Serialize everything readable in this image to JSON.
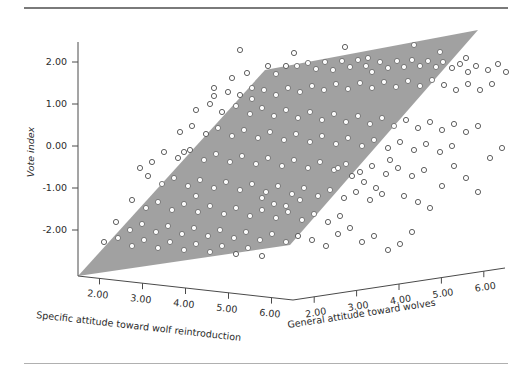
{
  "figure": {
    "background_color": "#ffffff",
    "plane_color": "#9a9a9a",
    "point_stroke_color": "#4f4f4f",
    "axis_color": "#4a4a4a"
  },
  "chart_data": {
    "type": "scatter",
    "title": "",
    "subtitle": "",
    "projection": "3d",
    "grid": false,
    "legend": null,
    "annotations": [],
    "surface": {
      "label": "regression plane",
      "color": "#9a9a9a",
      "screen_vertices": [
        [
          78,
          276
        ],
        [
          265,
          70
        ],
        [
          478,
          30
        ],
        [
          290,
          245
        ]
      ]
    },
    "axes": {
      "x": {
        "label": "Specific attitude toward wolf reintroduction",
        "ticks": [
          "2.00",
          "3.00",
          "4.00",
          "5.00",
          "6.00"
        ],
        "tickvalues": [
          2,
          3,
          4,
          5,
          6
        ],
        "range": [
          1.2,
          6.6
        ]
      },
      "y": {
        "label": "General attitude toward wolves",
        "ticks": [
          "2.00",
          "3.00",
          "4.00",
          "5.00",
          "6.00"
        ],
        "tickvalues": [
          2,
          3,
          4,
          5,
          6
        ],
        "range": [
          1.2,
          6.6
        ]
      },
      "z": {
        "label": "Vote index",
        "ticks": [
          "2.00",
          "1.00",
          "0.00",
          "-1.00",
          "-2.00"
        ],
        "tickvalues": [
          2,
          1,
          0,
          -1,
          -2
        ],
        "range": [
          -2.7,
          2.7
        ]
      }
    },
    "points": [
      [
        240,
        50
      ],
      [
        294,
        53
      ],
      [
        345,
        47
      ],
      [
        368,
        58
      ],
      [
        414,
        45
      ],
      [
        440,
        52
      ],
      [
        466,
        58
      ],
      [
        214,
        88
      ],
      [
        232,
        78
      ],
      [
        247,
        73
      ],
      [
        252,
        88
      ],
      [
        268,
        66
      ],
      [
        276,
        74
      ],
      [
        286,
        66
      ],
      [
        297,
        66
      ],
      [
        308,
        63
      ],
      [
        316,
        69
      ],
      [
        325,
        62
      ],
      [
        333,
        70
      ],
      [
        342,
        61
      ],
      [
        350,
        67
      ],
      [
        358,
        60
      ],
      [
        366,
        66
      ],
      [
        372,
        72
      ],
      [
        380,
        62
      ],
      [
        388,
        68
      ],
      [
        397,
        61
      ],
      [
        404,
        67
      ],
      [
        412,
        60
      ],
      [
        420,
        66
      ],
      [
        428,
        61
      ],
      [
        436,
        67
      ],
      [
        443,
        62
      ],
      [
        452,
        68
      ],
      [
        460,
        64
      ],
      [
        468,
        72
      ],
      [
        476,
        66
      ],
      [
        488,
        70
      ],
      [
        498,
        64
      ],
      [
        506,
        72
      ],
      [
        214,
        96
      ],
      [
        228,
        92
      ],
      [
        240,
        95
      ],
      [
        252,
        99
      ],
      [
        264,
        90
      ],
      [
        276,
        95
      ],
      [
        288,
        88
      ],
      [
        300,
        92
      ],
      [
        312,
        86
      ],
      [
        324,
        90
      ],
      [
        336,
        84
      ],
      [
        348,
        89
      ],
      [
        360,
        83
      ],
      [
        372,
        88
      ],
      [
        384,
        82
      ],
      [
        396,
        87
      ],
      [
        408,
        81
      ],
      [
        420,
        86
      ],
      [
        432,
        80
      ],
      [
        444,
        85
      ],
      [
        456,
        90
      ],
      [
        468,
        84
      ],
      [
        480,
        90
      ],
      [
        492,
        84
      ],
      [
        196,
        110
      ],
      [
        210,
        104
      ],
      [
        222,
        112
      ],
      [
        236,
        106
      ],
      [
        250,
        114
      ],
      [
        262,
        108
      ],
      [
        274,
        116
      ],
      [
        286,
        110
      ],
      [
        298,
        118
      ],
      [
        310,
        112
      ],
      [
        322,
        120
      ],
      [
        334,
        114
      ],
      [
        346,
        122
      ],
      [
        358,
        116
      ],
      [
        370,
        124
      ],
      [
        382,
        118
      ],
      [
        394,
        126
      ],
      [
        406,
        120
      ],
      [
        418,
        128
      ],
      [
        430,
        122
      ],
      [
        442,
        130
      ],
      [
        454,
        124
      ],
      [
        466,
        132
      ],
      [
        478,
        126
      ],
      [
        180,
        132
      ],
      [
        192,
        126
      ],
      [
        206,
        134
      ],
      [
        218,
        128
      ],
      [
        232,
        136
      ],
      [
        244,
        130
      ],
      [
        258,
        138
      ],
      [
        270,
        132
      ],
      [
        284,
        140
      ],
      [
        296,
        134
      ],
      [
        310,
        142
      ],
      [
        322,
        136
      ],
      [
        336,
        144
      ],
      [
        348,
        138
      ],
      [
        362,
        146
      ],
      [
        374,
        140
      ],
      [
        388,
        148
      ],
      [
        400,
        142
      ],
      [
        414,
        150
      ],
      [
        426,
        144
      ],
      [
        440,
        152
      ],
      [
        452,
        146
      ],
      [
        164,
        152
      ],
      [
        178,
        158
      ],
      [
        190,
        150
      ],
      [
        204,
        160
      ],
      [
        216,
        154
      ],
      [
        230,
        162
      ],
      [
        242,
        156
      ],
      [
        256,
        164
      ],
      [
        268,
        158
      ],
      [
        282,
        166
      ],
      [
        294,
        160
      ],
      [
        308,
        168
      ],
      [
        320,
        162
      ],
      [
        334,
        170
      ],
      [
        346,
        164
      ],
      [
        360,
        172
      ],
      [
        372,
        166
      ],
      [
        386,
        174
      ],
      [
        398,
        168
      ],
      [
        412,
        176
      ],
      [
        424,
        170
      ],
      [
        148,
        176
      ],
      [
        162,
        184
      ],
      [
        174,
        178
      ],
      [
        188,
        186
      ],
      [
        200,
        180
      ],
      [
        214,
        188
      ],
      [
        226,
        182
      ],
      [
        240,
        190
      ],
      [
        252,
        184
      ],
      [
        266,
        192
      ],
      [
        278,
        186
      ],
      [
        292,
        194
      ],
      [
        304,
        188
      ],
      [
        318,
        196
      ],
      [
        330,
        190
      ],
      [
        344,
        198
      ],
      [
        356,
        192
      ],
      [
        370,
        200
      ],
      [
        382,
        194
      ],
      [
        132,
        200
      ],
      [
        146,
        208
      ],
      [
        158,
        202
      ],
      [
        172,
        210
      ],
      [
        184,
        204
      ],
      [
        198,
        212
      ],
      [
        210,
        206
      ],
      [
        224,
        214
      ],
      [
        236,
        208
      ],
      [
        250,
        216
      ],
      [
        262,
        210
      ],
      [
        276,
        218
      ],
      [
        288,
        212
      ],
      [
        302,
        220
      ],
      [
        314,
        214
      ],
      [
        328,
        222
      ],
      [
        340,
        216
      ],
      [
        116,
        222
      ],
      [
        130,
        230
      ],
      [
        142,
        224
      ],
      [
        156,
        232
      ],
      [
        168,
        226
      ],
      [
        182,
        234
      ],
      [
        194,
        228
      ],
      [
        208,
        236
      ],
      [
        220,
        230
      ],
      [
        234,
        238
      ],
      [
        246,
        232
      ],
      [
        260,
        240
      ],
      [
        272,
        234
      ],
      [
        286,
        242
      ],
      [
        298,
        236
      ],
      [
        104,
        242
      ],
      [
        118,
        238
      ],
      [
        132,
        246
      ],
      [
        144,
        240
      ],
      [
        158,
        248
      ],
      [
        170,
        242
      ],
      [
        184,
        250
      ],
      [
        196,
        244
      ],
      [
        210,
        252
      ],
      [
        222,
        246
      ],
      [
        236,
        254
      ],
      [
        248,
        248
      ],
      [
        262,
        256
      ],
      [
        196,
        196
      ],
      [
        184,
        152
      ],
      [
        152,
        162
      ],
      [
        140,
        168
      ],
      [
        338,
        168
      ],
      [
        352,
        176
      ],
      [
        364,
        182
      ],
      [
        376,
        188
      ],
      [
        390,
        160
      ],
      [
        404,
        196
      ],
      [
        418,
        202
      ],
      [
        430,
        208
      ],
      [
        442,
        186
      ],
      [
        454,
        166
      ],
      [
        466,
        178
      ],
      [
        478,
        192
      ],
      [
        490,
        158
      ],
      [
        502,
        148
      ],
      [
        312,
        240
      ],
      [
        326,
        246
      ],
      [
        338,
        234
      ],
      [
        350,
        228
      ],
      [
        362,
        242
      ],
      [
        374,
        236
      ],
      [
        388,
        250
      ],
      [
        400,
        244
      ],
      [
        412,
        232
      ],
      [
        286,
        206
      ],
      [
        300,
        200
      ],
      [
        274,
        204
      ],
      [
        262,
        198
      ]
    ]
  }
}
